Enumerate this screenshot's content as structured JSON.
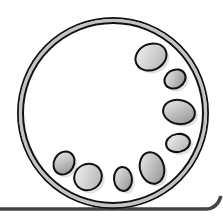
{
  "illustration": {
    "subject": "ring with pebbles",
    "colors": {
      "background": "#ffffff",
      "outline": "#111111",
      "ring_fill": "#c8c8c8",
      "pebble_light": "#e6e6e6",
      "pebble_dark": "#8a8a8a",
      "ground_line": "#444444"
    },
    "ring": {
      "cx": 113,
      "cy": 113,
      "r": 93
    },
    "pebbles": [
      {
        "cx": 151,
        "cy": 57,
        "rx": 16,
        "ry": 13,
        "rot": -25
      },
      {
        "cx": 175,
        "cy": 79,
        "rx": 11,
        "ry": 9,
        "rot": -30
      },
      {
        "cx": 179,
        "cy": 112,
        "rx": 16,
        "ry": 12,
        "rot": 10
      },
      {
        "cx": 178,
        "cy": 143,
        "rx": 12,
        "ry": 9,
        "rot": -10
      },
      {
        "cx": 152,
        "cy": 168,
        "rx": 12,
        "ry": 16,
        "rot": -15
      },
      {
        "cx": 123,
        "cy": 179,
        "rx": 9,
        "ry": 12,
        "rot": -5
      },
      {
        "cx": 88,
        "cy": 177,
        "rx": 14,
        "ry": 13,
        "rot": -30
      },
      {
        "cx": 64,
        "cy": 163,
        "rx": 10,
        "ry": 12,
        "rot": 30
      }
    ]
  }
}
